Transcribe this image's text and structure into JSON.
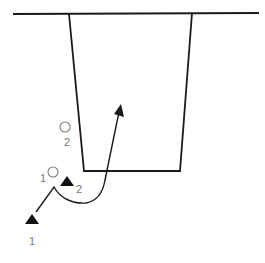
{
  "diagram": {
    "colors": {
      "line": "#1a1a1a",
      "label": "#777777",
      "background": "#ffffff"
    },
    "baseline": {
      "x1": 13,
      "y1": 14,
      "x2": 259,
      "y2": 13
    },
    "lane": {
      "top_left": [
        69,
        14
      ],
      "top_right": [
        192,
        13
      ],
      "bottom_right": [
        180,
        171
      ],
      "bottom_left": [
        84,
        171
      ]
    },
    "defenders": [
      {
        "id": "circle-1",
        "label": "1",
        "cx": 53,
        "cy": 172,
        "r": 5,
        "label_x": 40,
        "label_y": 182
      },
      {
        "id": "circle-2",
        "label": "2",
        "cx": 65,
        "cy": 127,
        "r": 5,
        "label_x": 64,
        "label_y": 146
      }
    ],
    "offense": [
      {
        "id": "triangle-1",
        "label": "1",
        "x": 32,
        "y": 215,
        "label_x": 29,
        "label_y": 245
      },
      {
        "id": "triangle-2",
        "label": "2",
        "x": 67,
        "y": 180,
        "label_x": 76,
        "label_y": 193
      }
    ],
    "movement_path": {
      "from_label": "1",
      "points_desc": "from triangle 1 up-right, loop under triangle 2, then cut into lane",
      "arrow_tip": [
        121,
        105
      ]
    }
  }
}
